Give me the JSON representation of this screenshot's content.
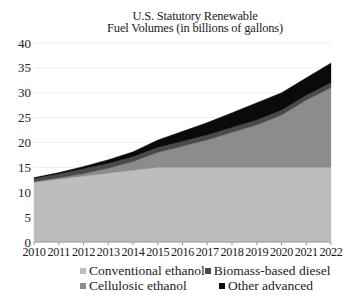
{
  "chart_data": {
    "type": "area",
    "stacked": true,
    "title": "U.S. Statutory Renewable Fuel Volumes (in billions of gallons)",
    "title_lines": [
      "U.S. Statutory Renewable",
      "Fuel Volumes (in billions of gallons)"
    ],
    "xlabel": "",
    "ylabel": "",
    "x": [
      2010,
      2011,
      2012,
      2013,
      2014,
      2015,
      2016,
      2017,
      2018,
      2019,
      2020,
      2021,
      2022
    ],
    "ylim": [
      0,
      40
    ],
    "yticks": [
      0,
      5,
      10,
      15,
      20,
      25,
      30,
      35,
      40
    ],
    "xticks": [
      "2010",
      "2011",
      "2012",
      "2013",
      "2014",
      "2015",
      "2016",
      "2017",
      "2018",
      "2019",
      "2020",
      "2021",
      "2022"
    ],
    "grid": true,
    "legend_position": "bottom",
    "series": [
      {
        "name": "Conventional ethanol",
        "color": "#bdbdbd",
        "values": [
          12.0,
          12.6,
          13.2,
          13.8,
          14.4,
          15.0,
          15.0,
          15.0,
          15.0,
          15.0,
          15.0,
          15.0,
          15.0
        ]
      },
      {
        "name": "Cellulosic ethanol",
        "color": "#8c8c8c",
        "values": [
          0.1,
          0.25,
          0.5,
          1.0,
          1.75,
          3.0,
          4.25,
          5.5,
          7.0,
          8.5,
          10.5,
          13.5,
          16.0
        ]
      },
      {
        "name": "Biomass-based diesel",
        "color": "#4a4a4a",
        "values": [
          0.65,
          0.8,
          1.0,
          1.0,
          1.0,
          1.0,
          1.0,
          1.0,
          1.0,
          1.0,
          1.0,
          1.0,
          1.0
        ]
      },
      {
        "name": "Other advanced",
        "color": "#0a0a0a",
        "values": [
          0.2,
          0.3,
          0.5,
          0.75,
          1.0,
          1.5,
          2.0,
          2.5,
          3.0,
          3.5,
          3.5,
          3.5,
          4.0
        ]
      }
    ]
  },
  "legend": {
    "rows": [
      [
        {
          "label": "Conventional ethanol",
          "color": "#bdbdbd"
        },
        {
          "label": "Biomass-based diesel",
          "color": "#4a4a4a"
        }
      ],
      [
        {
          "label": "Cellulosic ethanol",
          "color": "#8c8c8c"
        },
        {
          "label": "Other advanced",
          "color": "#0a0a0a"
        }
      ]
    ]
  }
}
